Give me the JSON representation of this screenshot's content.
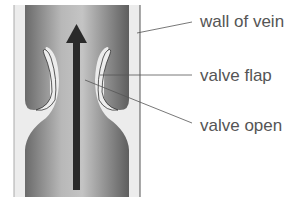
{
  "diagram": {
    "labels": [
      {
        "id": "wall",
        "text": "wall of vein"
      },
      {
        "id": "flap",
        "text": "valve flap"
      },
      {
        "id": "open",
        "text": "valve open"
      }
    ],
    "arrow": {
      "direction": "up",
      "meaning": "blood flow"
    },
    "colors": {
      "wall": "#e8e8e8",
      "lumen_dark": "#6e6e6e",
      "lumen_light": "#c8c8c8",
      "arrow": "#2a2a2a",
      "line": "#555555"
    }
  }
}
